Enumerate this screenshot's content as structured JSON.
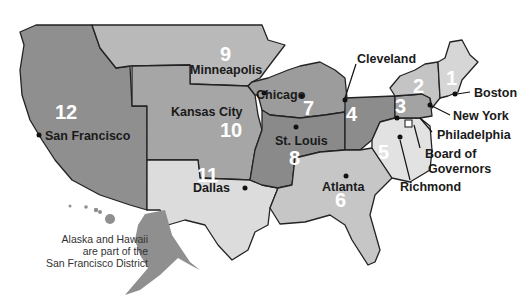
{
  "map": {
    "title": "Federal Reserve Districts",
    "districts": [
      {
        "number": "1",
        "city": "Boston"
      },
      {
        "number": "2",
        "city": "New York"
      },
      {
        "number": "3",
        "city": "Philadelphia"
      },
      {
        "number": "4",
        "city": "Cleveland"
      },
      {
        "number": "5",
        "city": "Richmond"
      },
      {
        "number": "6",
        "city": "Atlanta"
      },
      {
        "number": "7",
        "city": "Chicago"
      },
      {
        "number": "8",
        "city": "St. Louis"
      },
      {
        "number": "9",
        "city": "Minneapolis"
      },
      {
        "number": "10",
        "city": "Kansas City"
      },
      {
        "number": "11",
        "city": "Dallas"
      },
      {
        "number": "12",
        "city": "San Francisco"
      }
    ],
    "board_label_line1": "Board of",
    "board_label_line2": "Governors",
    "note_line1": "Alaska and Hawaii",
    "note_line2": "are part of the",
    "note_line3": "San Francisco District",
    "colors": {
      "d12": "#8f8f8f",
      "d9": "#b9b9b9",
      "d10": "#a6a6a6",
      "d11": "#dcdcdc",
      "d7": "#9c9c9c",
      "d8": "#8a8a8a",
      "d6": "#c6c6c6",
      "d4": "#8c8c8c",
      "d5": "#e2e2e2",
      "d3": "#a3a3a3",
      "d2": "#c4c4c4",
      "d1": "#d6d6d6"
    }
  }
}
